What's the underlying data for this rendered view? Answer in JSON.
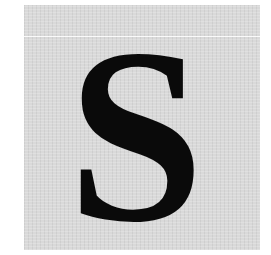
{
  "card": {
    "letter": "S",
    "background_color": "#d9d9d9",
    "letter_color": "#0a0a0a"
  }
}
